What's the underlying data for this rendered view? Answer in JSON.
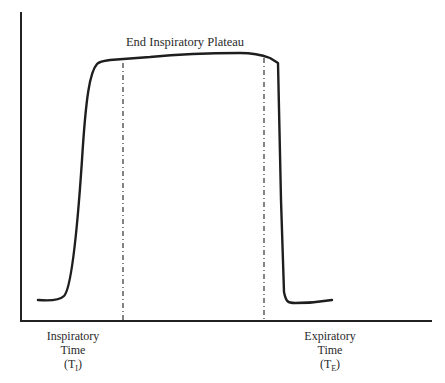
{
  "diagram": {
    "title": "End Inspiratory Plateau",
    "labels": {
      "inspiratory": {
        "line1": "Inspiratory",
        "line2": "Time",
        "symbol_open": "(T",
        "symbol_sub": "I",
        "symbol_close": ")"
      },
      "expiratory": {
        "line1": "Expiratory",
        "line2": "Time",
        "symbol_open": "(T",
        "symbol_sub": "E",
        "symbol_close": ")"
      }
    },
    "colors": {
      "line": "#222222",
      "background": "#ffffff"
    },
    "elements": {
      "y_axis": "vertical axis line",
      "x_axis": "horizontal axis line",
      "waveform": "pressure waveform with rise, end inspiratory plateau and fall",
      "marker_left": "dash-dot vertical marker at start of plateau",
      "marker_right": "dash-dot vertical marker at end of plateau"
    }
  }
}
